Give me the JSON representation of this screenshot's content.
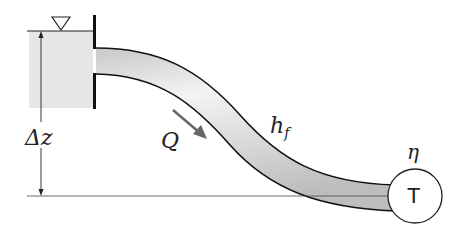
{
  "diagram": {
    "labels": {
      "elevation": "Δz",
      "flow": "Q",
      "head_loss_main": "h",
      "head_loss_sub": "f",
      "efficiency": "η",
      "turbine": "T"
    },
    "colors": {
      "water": "#e6e6e6",
      "pipe_fill": "#dcdcdc",
      "outline": "#111111",
      "arrow": "#666666"
    }
  }
}
